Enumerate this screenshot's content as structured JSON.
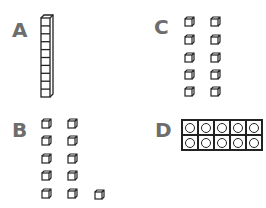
{
  "options": [
    {
      "label": "A",
      "kind": "ten-rod",
      "count": 10
    },
    {
      "label": "B",
      "kind": "unit-cubes",
      "count": 11,
      "layout": "5 rows of 2 plus 1"
    },
    {
      "label": "C",
      "kind": "unit-cubes",
      "count": 10,
      "layout": "5 rows of 2"
    },
    {
      "label": "D",
      "kind": "ten-frame",
      "count": 10,
      "layout": "2 rows of 5 circles"
    }
  ],
  "colors": {
    "label": "#6d6d6d",
    "stroke": "#222222",
    "background": "#ffffff"
  }
}
